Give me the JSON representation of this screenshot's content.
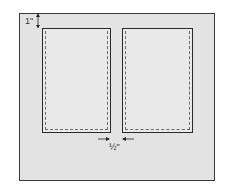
{
  "diagram": {
    "top_margin_label": "1\"",
    "gap_label": "½\"",
    "panels": [
      {
        "name": "left-panel"
      },
      {
        "name": "right-panel"
      }
    ],
    "colors": {
      "frame_fill": "#e3e3e3",
      "panel_fill": "#e9e9e9",
      "stroke": "#2a2a2a",
      "dashed": "#6a6a6a"
    }
  }
}
